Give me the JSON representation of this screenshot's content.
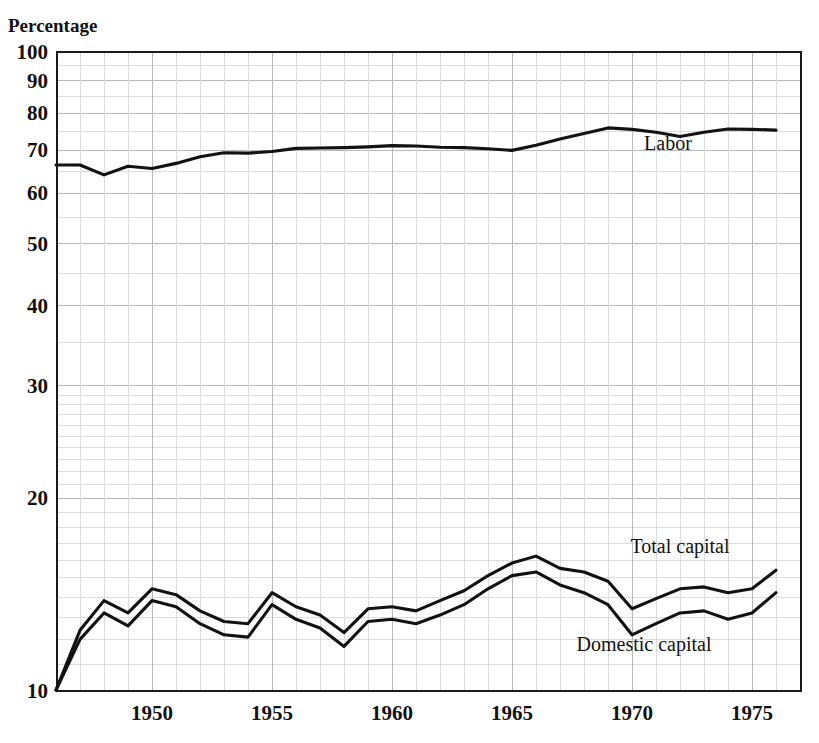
{
  "chart_data": {
    "type": "line",
    "title": "",
    "ylabel": "Percentage",
    "xlabel": "",
    "yscale": "log",
    "ylim": [
      10,
      100
    ],
    "xlim": [
      1946,
      1977
    ],
    "grid": true,
    "legend_position": "inline-right",
    "y_major_ticks": [
      10,
      20,
      30,
      40,
      50,
      60,
      70,
      80,
      90,
      100
    ],
    "y_major_tick_labels": [
      "10",
      "20",
      "30",
      "40",
      "50",
      "60",
      "70",
      "80",
      "90",
      "100"
    ],
    "y_minor_ticks": [
      11,
      12,
      13,
      14,
      15,
      16,
      17,
      18,
      19,
      21,
      22,
      23,
      24,
      25,
      26,
      27,
      28,
      29,
      35,
      45,
      55,
      65,
      75,
      85,
      95
    ],
    "x_major_ticks": [
      1950,
      1955,
      1960,
      1965,
      1970,
      1975
    ],
    "x_tick_labels": [
      "1950",
      "1955",
      "1960",
      "1965",
      "1970",
      "1975"
    ],
    "x": [
      1946,
      1947,
      1948,
      1949,
      1950,
      1951,
      1952,
      1953,
      1954,
      1955,
      1956,
      1957,
      1958,
      1959,
      1960,
      1961,
      1962,
      1963,
      1964,
      1965,
      1966,
      1967,
      1968,
      1969,
      1970,
      1971,
      1972,
      1973,
      1974,
      1975,
      1976
    ],
    "series": [
      {
        "name": "Labor",
        "label": "Labor",
        "color": "#121212",
        "values": [
          66.3,
          66.3,
          64.0,
          66.0,
          65.5,
          66.7,
          68.3,
          69.3,
          69.2,
          69.6,
          70.4,
          70.5,
          70.6,
          70.8,
          71.1,
          71.0,
          70.7,
          70.6,
          70.3,
          69.9,
          71.2,
          72.8,
          74.3,
          75.8,
          75.4,
          74.6,
          73.5,
          74.6,
          75.5,
          75.4,
          75.2
        ]
      },
      {
        "name": "Total capital",
        "label": "Total capital",
        "color": "#121212",
        "values": [
          10.0,
          12.4,
          13.8,
          13.2,
          14.4,
          14.1,
          13.3,
          12.8,
          12.7,
          14.2,
          13.5,
          13.1,
          12.3,
          13.4,
          13.5,
          13.3,
          13.8,
          14.3,
          15.1,
          15.8,
          16.2,
          15.5,
          15.3,
          14.8,
          13.4,
          13.9,
          14.4,
          14.5,
          14.2,
          14.4,
          15.4
        ]
      },
      {
        "name": "Domestic capital",
        "label": "Domestic capital",
        "color": "#121212",
        "values": [
          10.0,
          12.0,
          13.2,
          12.6,
          13.8,
          13.5,
          12.7,
          12.2,
          12.1,
          13.6,
          12.9,
          12.5,
          11.7,
          12.8,
          12.9,
          12.7,
          13.1,
          13.6,
          14.4,
          15.1,
          15.3,
          14.6,
          14.2,
          13.6,
          12.2,
          12.7,
          13.2,
          13.3,
          12.9,
          13.2,
          14.2
        ]
      }
    ],
    "annotations": [
      {
        "text": "Labor",
        "x": 1971.5,
        "y": 70.0
      },
      {
        "text": "Total capital",
        "x": 1972.0,
        "y": 16.4
      },
      {
        "text": "Domestic capital",
        "x": 1970.5,
        "y": 11.5
      }
    ]
  },
  "layout": {
    "plot_left": 56,
    "plot_right": 800,
    "plot_top": 51,
    "plot_bottom": 690
  }
}
